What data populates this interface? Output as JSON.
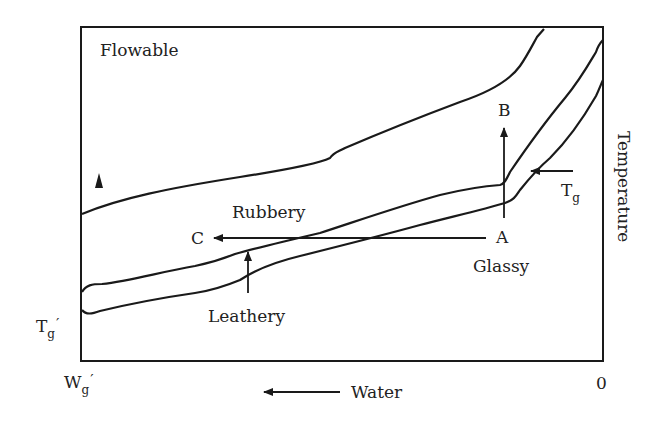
{
  "diagram": {
    "type": "state-diagram",
    "axes": {
      "y_label": "Temperature",
      "x_label": "Water",
      "x_direction_arrow": "left",
      "x_left_tick_main": "W",
      "x_left_tick_sub": "g",
      "x_left_tick_prime": "′",
      "x_right_tick": "0",
      "y_low_tick_main": "T",
      "y_low_tick_sub": "g",
      "y_low_tick_prime": "′"
    },
    "regions": {
      "flowable": "Flowable",
      "rubbery": "Rubbery",
      "leathery": "Leathery",
      "glassy": "Glassy"
    },
    "points": {
      "a": "A",
      "b": "B",
      "c": "C"
    },
    "curve_labels": {
      "tg_main": "T",
      "tg_sub": "g"
    },
    "colors": {
      "line": "#1a1a1a",
      "background": "#ffffff",
      "text": "#222222"
    }
  }
}
